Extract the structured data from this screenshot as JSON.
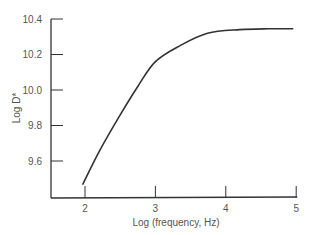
{
  "chart_data": {
    "type": "line",
    "title": "",
    "xlabel": "Log (frequency, Hz)",
    "ylabel": "Log D*",
    "xlim": [
      1.9,
      5.0
    ],
    "ylim": [
      9.4,
      10.4
    ],
    "xticks": [
      2,
      3,
      4,
      5
    ],
    "xtick_labels": [
      "2",
      "3",
      "4",
      "5"
    ],
    "yticks": [
      9.6,
      9.8,
      10.0,
      10.2,
      10.4
    ],
    "ytick_labels": [
      "9.6",
      "9.8",
      "10.0",
      "10.2",
      "10.4"
    ],
    "grid": false,
    "legend": "none",
    "series": [
      {
        "name": "Log D*",
        "x": [
          1.97,
          2.21,
          2.5,
          2.75,
          3.0,
          3.35,
          3.74,
          4.2,
          4.6,
          4.95
        ],
        "y": [
          9.47,
          9.66,
          9.86,
          10.02,
          10.16,
          10.25,
          10.32,
          10.34,
          10.345,
          10.345
        ]
      }
    ]
  }
}
